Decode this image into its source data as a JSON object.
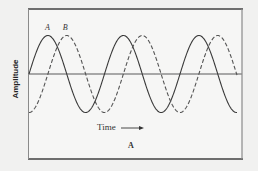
{
  "chart_data": {
    "type": "line",
    "title": "",
    "panel_label": "A",
    "xlabel": "Time",
    "xlabel_arrow": "→",
    "ylabel": "Amplitude",
    "grid": false,
    "legend": "inline labels above first peaks",
    "x_ticks": [],
    "y_ticks": [],
    "xlim": [
      0,
      2.75
    ],
    "ylim": [
      -1.2,
      1.2
    ],
    "x_unit": "periods",
    "series": [
      {
        "name": "A",
        "style": "solid",
        "description": "sine wave starting at zero amplitude, rising",
        "amplitude": 1,
        "period": 1,
        "phase_shift_periods": 0,
        "peaks_at": [
          0.25,
          1.25,
          2.25
        ],
        "troughs_at": [
          0.75,
          1.75,
          2.75
        ]
      },
      {
        "name": "B",
        "style": "dashed",
        "description": "same sine wave lagging A by a quarter period",
        "amplitude": 1,
        "period": 1,
        "phase_shift_periods": 0.25,
        "peaks_at": [
          0.5,
          1.5,
          2.5
        ],
        "troughs_at": [
          0.0,
          1.0,
          2.0
        ]
      }
    ]
  },
  "colors": {
    "background": "#f1f1f0",
    "plot_background": "#f6f6f5",
    "frame": "#8a8a8a",
    "frame_thick": "#6e6e6e",
    "baseline": "#8c8c8c",
    "series_a": "#3a3a3a",
    "series_b": "#555555"
  }
}
